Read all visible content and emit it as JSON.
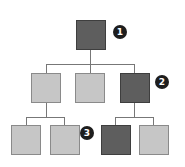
{
  "diagram": {
    "type": "tree",
    "colors": {
      "highlighted": "#5e5e5e",
      "normal": "#c6c6c6",
      "line": "#777777",
      "badge": "#1e1e1e"
    },
    "nodes": [
      {
        "id": "root",
        "level": 0,
        "highlighted": true
      },
      {
        "id": "l1-a",
        "level": 1,
        "parent": "root",
        "highlighted": false
      },
      {
        "id": "l1-b",
        "level": 1,
        "parent": "root",
        "highlighted": false
      },
      {
        "id": "l1-c",
        "level": 1,
        "parent": "root",
        "highlighted": true
      },
      {
        "id": "l2-a",
        "level": 2,
        "parent": "l1-a",
        "highlighted": false
      },
      {
        "id": "l2-b",
        "level": 2,
        "parent": "l1-a",
        "highlighted": false
      },
      {
        "id": "l2-c",
        "level": 2,
        "parent": "l1-c",
        "highlighted": true
      },
      {
        "id": "l2-d",
        "level": 2,
        "parent": "l1-c",
        "highlighted": false
      }
    ],
    "badges": [
      {
        "label": "1",
        "target": "root"
      },
      {
        "label": "2",
        "target": "l1-c"
      },
      {
        "label": "3",
        "target": "l2-c"
      }
    ]
  }
}
